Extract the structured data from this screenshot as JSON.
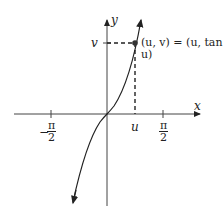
{
  "diagram": {
    "axes": {
      "x_label": "x",
      "y_label": "y"
    },
    "ticks": {
      "neg_half_pi": {
        "sign": "−",
        "num": "π",
        "den": "2"
      },
      "pos_half_pi": {
        "num": "π",
        "den": "2"
      },
      "u_label": "u",
      "v_label": "v"
    },
    "point_label": "(u, v) = (u, tan u)",
    "curve": "y = tan x on (−π/2, π/2)"
  }
}
